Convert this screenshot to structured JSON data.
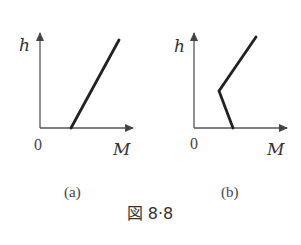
{
  "figure": {
    "caption": "図 8·8",
    "panels": [
      {
        "id": "a",
        "label": "(a)",
        "y_axis_label": "h",
        "x_axis_label": "M",
        "origin_label": "0",
        "curve_description": "straight line starting on M-axis at positive M, rising to upper right"
      },
      {
        "id": "b",
        "label": "(b)",
        "y_axis_label": "h",
        "x_axis_label": "M",
        "origin_label": "0",
        "curve_description": "line starting on M-axis, going up-left to a kink, then rising up-right"
      }
    ]
  },
  "colors": {
    "axis": "#555555",
    "curve": "#222222",
    "text": "#333333"
  }
}
